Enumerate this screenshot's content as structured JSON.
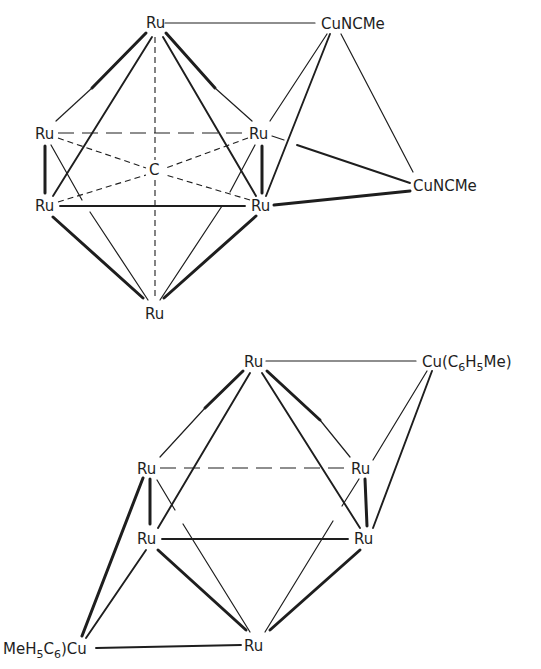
{
  "figure": {
    "structures": [
      {
        "id": "top",
        "description": "Octahedral Ru6 carbido cluster with two CuNCMe capping groups",
        "atoms": {
          "ru_top": "Ru",
          "ru_left_mid": "Ru",
          "ru_right_mid": "Ru",
          "ru_left_low": "Ru",
          "ru_right_low": "Ru",
          "ru_bottom": "Ru",
          "carbide": "C",
          "cu_top": "CuNCMe",
          "cu_right": "CuNCMe"
        }
      },
      {
        "id": "bottom",
        "description": "Octahedral Ru6 cluster with two Cu(C6H5Me) capping groups",
        "atoms": {
          "ru_top": "Ru",
          "ru_left_mid": "Ru",
          "ru_right_mid": "Ru",
          "ru_left_low": "Ru",
          "ru_right_low": "Ru",
          "ru_bottom": "Ru",
          "cu_top": {
            "prefix": "Cu(C",
            "sub1": "6",
            "mid": "H",
            "sub2": "5",
            "suffix": "Me)"
          },
          "cu_left": {
            "prefix": "MeH",
            "sub1": "5",
            "mid": "C",
            "sub2": "6",
            "suffix": ")Cu"
          }
        }
      }
    ]
  },
  "colors": {
    "ink": "#1e1e1e",
    "background": "#ffffff"
  }
}
